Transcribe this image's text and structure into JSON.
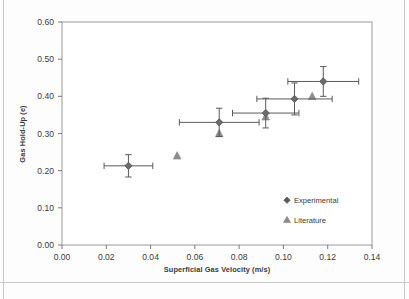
{
  "chart_data": {
    "type": "scatter",
    "title": "",
    "xlabel": "Superficial Gas Velocity (m/s)",
    "ylabel": "Gas Hold-Up (e)",
    "xlim": [
      0.0,
      0.14
    ],
    "ylim": [
      0.0,
      0.6
    ],
    "xticks": [
      "0.00",
      "0.02",
      "0.04",
      "0.06",
      "0.08",
      "0.10",
      "0.12",
      "0.14"
    ],
    "xtick_values": [
      0.0,
      0.02,
      0.04,
      0.06,
      0.08,
      0.1,
      0.12,
      0.14
    ],
    "yticks": [
      "0.00",
      "0.10",
      "0.20",
      "0.30",
      "0.40",
      "0.50",
      "0.60"
    ],
    "ytick_values": [
      0.0,
      0.1,
      0.2,
      0.3,
      0.4,
      0.5,
      0.6
    ],
    "grid": false,
    "legend_position": "inside-lower-right",
    "series": [
      {
        "name": "Experimental",
        "marker": "diamond",
        "color": "#5a5a5a",
        "points": [
          {
            "x": 0.03,
            "y": 0.213,
            "xerr": 0.011,
            "yerr": 0.03
          },
          {
            "x": 0.071,
            "y": 0.33,
            "xerr": 0.018,
            "yerr": 0.038
          },
          {
            "x": 0.092,
            "y": 0.355,
            "xerr": 0.015,
            "yerr": 0.04
          },
          {
            "x": 0.105,
            "y": 0.393,
            "xerr": 0.017,
            "yerr": 0.043
          },
          {
            "x": 0.118,
            "y": 0.44,
            "xerr": 0.016,
            "yerr": 0.04
          }
        ]
      },
      {
        "name": "Literature",
        "marker": "triangle",
        "color": "#8c8c8c",
        "points": [
          {
            "x": 0.052,
            "y": 0.24
          },
          {
            "x": 0.071,
            "y": 0.3
          },
          {
            "x": 0.092,
            "y": 0.345
          },
          {
            "x": 0.113,
            "y": 0.4
          }
        ]
      }
    ]
  },
  "legend": {
    "entries": [
      {
        "label": "Experimental",
        "marker": "diamond"
      },
      {
        "label": "Literature",
        "marker": "triangle"
      }
    ]
  },
  "colors": {
    "experimental": "#5a5a5a",
    "literature": "#8c8c8c",
    "axis": "#7a7a7a",
    "text": "#3a3a3a"
  }
}
